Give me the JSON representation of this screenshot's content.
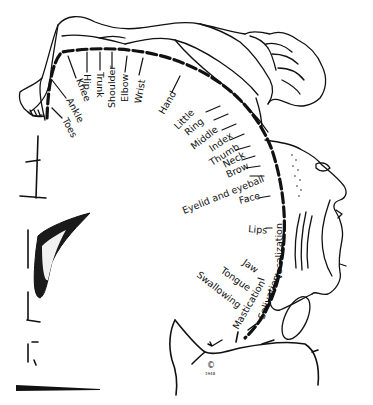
{
  "diagram": {
    "type": "motor homunculus (cortical motor map)",
    "labels": [
      {
        "id": "toes",
        "text": "Toes"
      },
      {
        "id": "ankle",
        "text": "Ankle"
      },
      {
        "id": "knee",
        "text": "Knee"
      },
      {
        "id": "hip",
        "text": "Hip"
      },
      {
        "id": "trunk",
        "text": "Trunk"
      },
      {
        "id": "shoulder",
        "text": "Shoulder"
      },
      {
        "id": "elbow",
        "text": "Elbow"
      },
      {
        "id": "wrist",
        "text": "Wrist"
      },
      {
        "id": "hand",
        "text": "Hand"
      },
      {
        "id": "little",
        "text": "Little"
      },
      {
        "id": "ring",
        "text": "Ring"
      },
      {
        "id": "middle",
        "text": "Middle"
      },
      {
        "id": "index",
        "text": "Index"
      },
      {
        "id": "thumb",
        "text": "Thumb"
      },
      {
        "id": "neck",
        "text": "Neck"
      },
      {
        "id": "brow",
        "text": "Brow"
      },
      {
        "id": "eyelid",
        "text": "Eyelid and eyeball"
      },
      {
        "id": "face",
        "text": "Face"
      },
      {
        "id": "lips",
        "text": "Lips"
      },
      {
        "id": "jaw",
        "text": "Jaw"
      },
      {
        "id": "tongue",
        "text": "Tongue"
      },
      {
        "id": "swallowing",
        "text": "Swallowing"
      },
      {
        "id": "mastication",
        "text": "Mastication"
      },
      {
        "id": "salivation",
        "text": "Salivation"
      },
      {
        "id": "vocalization",
        "text": "Vocalization"
      }
    ],
    "copyright": {
      "symbol": "©",
      "year": "1948"
    },
    "colors": {
      "ink": "#111111",
      "background": "#ffffff"
    }
  }
}
